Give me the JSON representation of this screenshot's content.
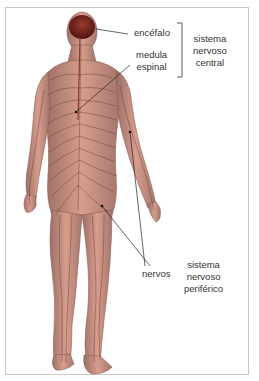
{
  "labels": {
    "encefalo": "encéfalo",
    "medula_line1": "medula",
    "medula_line2": "espinal",
    "central_line1": "sistema",
    "central_line2": "nervoso",
    "central_line3": "central",
    "nervos": "nervos",
    "periferico_line1": "sistema",
    "periferico_line2": "nervoso",
    "periferico_line3": "periférico"
  },
  "colors": {
    "skin": "#c98f7f",
    "brain": "#7a2a22",
    "nerve": "#5a2a24",
    "text": "#333333"
  }
}
